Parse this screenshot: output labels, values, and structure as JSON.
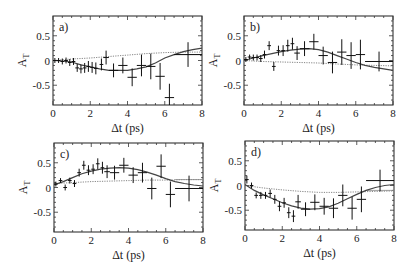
{
  "figure": {
    "ylabel": "A_T",
    "xlabel": "Δt (ps)",
    "x_ticks": [
      "0",
      "2",
      "4",
      "6",
      "8"
    ],
    "y_ticks": [
      "0.5",
      "0",
      "-0.5"
    ]
  },
  "chart_data": [
    {
      "type": "scatter",
      "panel": "a)",
      "xlabel": "Δt (ps)",
      "ylabel": "A_T",
      "xlim": [
        0,
        8
      ],
      "ylim": [
        -0.9,
        0.9
      ],
      "grid": false,
      "frame": {
        "left": 53,
        "right": 202,
        "top": 16,
        "bottom": 105
      },
      "points": [
        {
          "x": 0.1,
          "y": 0.0,
          "xerr": 0.1,
          "yerr": 0.05
        },
        {
          "x": 0.3,
          "y": 0.0,
          "xerr": 0.1,
          "yerr": 0.05
        },
        {
          "x": 0.5,
          "y": -0.02,
          "xerr": 0.1,
          "yerr": 0.06
        },
        {
          "x": 0.7,
          "y": 0.0,
          "xerr": 0.1,
          "yerr": 0.06
        },
        {
          "x": 0.9,
          "y": -0.04,
          "xerr": 0.1,
          "yerr": 0.07
        },
        {
          "x": 1.1,
          "y": -0.02,
          "xerr": 0.1,
          "yerr": 0.07
        },
        {
          "x": 1.3,
          "y": -0.15,
          "xerr": 0.1,
          "yerr": 0.08
        },
        {
          "x": 1.5,
          "y": -0.17,
          "xerr": 0.1,
          "yerr": 0.09
        },
        {
          "x": 1.7,
          "y": -0.15,
          "xerr": 0.1,
          "yerr": 0.1
        },
        {
          "x": 1.9,
          "y": -0.12,
          "xerr": 0.1,
          "yerr": 0.11
        },
        {
          "x": 2.1,
          "y": -0.14,
          "xerr": 0.1,
          "yerr": 0.11
        },
        {
          "x": 2.3,
          "y": -0.16,
          "xerr": 0.1,
          "yerr": 0.12
        },
        {
          "x": 2.6,
          "y": -0.08,
          "xerr": 0.1,
          "yerr": 0.12
        },
        {
          "x": 2.85,
          "y": 0.06,
          "xerr": 0.15,
          "yerr": 0.14
        },
        {
          "x": 3.25,
          "y": -0.2,
          "xerr": 0.25,
          "yerr": 0.14
        },
        {
          "x": 3.75,
          "y": -0.1,
          "xerr": 0.25,
          "yerr": 0.16
        },
        {
          "x": 4.25,
          "y": -0.34,
          "xerr": 0.25,
          "yerr": 0.18
        },
        {
          "x": 4.75,
          "y": -0.1,
          "xerr": 0.25,
          "yerr": 0.22
        },
        {
          "x": 5.25,
          "y": -0.12,
          "xerr": 0.25,
          "yerr": 0.26
        },
        {
          "x": 5.75,
          "y": -0.32,
          "xerr": 0.25,
          "yerr": 0.27
        },
        {
          "x": 6.25,
          "y": -0.75,
          "xerr": 0.25,
          "yerr": 0.28
        },
        {
          "x": 7.25,
          "y": 0.12,
          "xerr": 0.75,
          "yerr": 0.25
        }
      ],
      "fit_solid": [
        [
          0,
          0
        ],
        [
          0.5,
          -0.01
        ],
        [
          1,
          -0.03
        ],
        [
          1.5,
          -0.09
        ],
        [
          2,
          -0.13
        ],
        [
          2.5,
          -0.17
        ],
        [
          3,
          -0.2
        ],
        [
          3.5,
          -0.2
        ],
        [
          4,
          -0.2
        ],
        [
          4.5,
          -0.17
        ],
        [
          5,
          -0.13
        ],
        [
          5.5,
          -0.05
        ],
        [
          6,
          0.05
        ],
        [
          6.5,
          0.12
        ],
        [
          7,
          0.18
        ],
        [
          7.5,
          0.22
        ],
        [
          8,
          0.25
        ]
      ],
      "fit_dotted": [
        [
          0,
          0.0
        ],
        [
          1,
          0.03
        ],
        [
          2,
          0.05
        ],
        [
          3,
          0.08
        ],
        [
          4,
          0.11
        ],
        [
          5,
          0.14
        ],
        [
          6,
          0.16
        ],
        [
          7,
          0.17
        ],
        [
          8,
          0.17
        ]
      ],
      "fit_dotted_flat": [
        [
          6.5,
          0.12
        ],
        [
          8,
          0.12
        ]
      ]
    },
    {
      "type": "scatter",
      "panel": "b)",
      "xlabel": "Δt (ps)",
      "ylabel": "A_T",
      "xlim": [
        0,
        8
      ],
      "ylim": [
        -0.9,
        0.9
      ],
      "grid": false,
      "frame": {
        "left": 244,
        "right": 393,
        "top": 16,
        "bottom": 105
      },
      "points": [
        {
          "x": 0.1,
          "y": 0.02,
          "xerr": 0.1,
          "yerr": 0.05
        },
        {
          "x": 0.3,
          "y": 0.07,
          "xerr": 0.1,
          "yerr": 0.05
        },
        {
          "x": 0.5,
          "y": 0.06,
          "xerr": 0.1,
          "yerr": 0.06
        },
        {
          "x": 0.7,
          "y": 0.06,
          "xerr": 0.1,
          "yerr": 0.06
        },
        {
          "x": 0.9,
          "y": 0.04,
          "xerr": 0.1,
          "yerr": 0.07
        },
        {
          "x": 1.1,
          "y": 0.12,
          "xerr": 0.1,
          "yerr": 0.08
        },
        {
          "x": 1.35,
          "y": 0.3,
          "xerr": 0.1,
          "yerr": 0.09
        },
        {
          "x": 1.6,
          "y": -0.12,
          "xerr": 0.1,
          "yerr": 0.09
        },
        {
          "x": 1.85,
          "y": 0.2,
          "xerr": 0.1,
          "yerr": 0.1
        },
        {
          "x": 2.1,
          "y": 0.2,
          "xerr": 0.1,
          "yerr": 0.11
        },
        {
          "x": 2.35,
          "y": 0.3,
          "xerr": 0.1,
          "yerr": 0.12
        },
        {
          "x": 2.6,
          "y": 0.34,
          "xerr": 0.1,
          "yerr": 0.12
        },
        {
          "x": 2.85,
          "y": 0.15,
          "xerr": 0.15,
          "yerr": 0.14
        },
        {
          "x": 3.25,
          "y": 0.24,
          "xerr": 0.25,
          "yerr": 0.15
        },
        {
          "x": 3.75,
          "y": 0.38,
          "xerr": 0.25,
          "yerr": 0.16
        },
        {
          "x": 4.25,
          "y": 0.1,
          "xerr": 0.25,
          "yerr": 0.18
        },
        {
          "x": 4.75,
          "y": -0.04,
          "xerr": 0.25,
          "yerr": 0.22
        },
        {
          "x": 5.25,
          "y": 0.17,
          "xerr": 0.25,
          "yerr": 0.26
        },
        {
          "x": 5.75,
          "y": 0.1,
          "xerr": 0.25,
          "yerr": 0.27
        },
        {
          "x": 6.25,
          "y": 0.12,
          "xerr": 0.25,
          "yerr": 0.3
        },
        {
          "x": 7.25,
          "y": -0.02,
          "xerr": 0.75,
          "yerr": 0.2
        }
      ],
      "fit_solid": [
        [
          0,
          0
        ],
        [
          0.5,
          0.05
        ],
        [
          1,
          0.1
        ],
        [
          1.5,
          0.14
        ],
        [
          2,
          0.18
        ],
        [
          2.5,
          0.21
        ],
        [
          3,
          0.23
        ],
        [
          3.5,
          0.24
        ],
        [
          4,
          0.22
        ],
        [
          4.5,
          0.17
        ],
        [
          5,
          0.1
        ],
        [
          5.5,
          0.03
        ],
        [
          6,
          -0.04
        ],
        [
          6.5,
          -0.1
        ],
        [
          7,
          -0.14
        ],
        [
          7.5,
          -0.17
        ],
        [
          8,
          -0.2
        ]
      ],
      "fit_dotted": [
        [
          0,
          0
        ],
        [
          1,
          -0.02
        ],
        [
          2,
          -0.03
        ],
        [
          3,
          -0.04
        ],
        [
          4,
          -0.05
        ],
        [
          5,
          -0.07
        ],
        [
          6,
          -0.09
        ],
        [
          7,
          -0.1
        ],
        [
          8,
          -0.11
        ]
      ],
      "fit_dotted_flat": [
        [
          6.5,
          -0.02
        ],
        [
          8,
          -0.02
        ]
      ]
    },
    {
      "type": "scatter",
      "panel": "c)",
      "xlabel": "Δt (ps)",
      "ylabel": "A_T",
      "xlim": [
        0,
        8
      ],
      "ylim": [
        -0.9,
        0.9
      ],
      "grid": false,
      "frame": {
        "left": 54,
        "right": 203,
        "top": 143,
        "bottom": 232
      },
      "points": [
        {
          "x": 0.1,
          "y": 0.07,
          "xerr": 0.1,
          "yerr": 0.05
        },
        {
          "x": 0.35,
          "y": 0.14,
          "xerr": 0.1,
          "yerr": 0.05
        },
        {
          "x": 0.6,
          "y": 0.0,
          "xerr": 0.1,
          "yerr": 0.06
        },
        {
          "x": 0.85,
          "y": 0.14,
          "xerr": 0.1,
          "yerr": 0.06
        },
        {
          "x": 1.1,
          "y": 0.08,
          "xerr": 0.1,
          "yerr": 0.07
        },
        {
          "x": 1.35,
          "y": 0.3,
          "xerr": 0.1,
          "yerr": 0.08
        },
        {
          "x": 1.6,
          "y": 0.45,
          "xerr": 0.1,
          "yerr": 0.09
        },
        {
          "x": 1.85,
          "y": 0.35,
          "xerr": 0.1,
          "yerr": 0.1
        },
        {
          "x": 2.1,
          "y": 0.37,
          "xerr": 0.1,
          "yerr": 0.1
        },
        {
          "x": 2.35,
          "y": 0.48,
          "xerr": 0.1,
          "yerr": 0.11
        },
        {
          "x": 2.6,
          "y": 0.4,
          "xerr": 0.1,
          "yerr": 0.12
        },
        {
          "x": 2.85,
          "y": 0.32,
          "xerr": 0.15,
          "yerr": 0.13
        },
        {
          "x": 3.25,
          "y": 0.3,
          "xerr": 0.25,
          "yerr": 0.14
        },
        {
          "x": 3.75,
          "y": 0.45,
          "xerr": 0.25,
          "yerr": 0.15
        },
        {
          "x": 4.25,
          "y": 0.25,
          "xerr": 0.25,
          "yerr": 0.16
        },
        {
          "x": 4.75,
          "y": 0.3,
          "xerr": 0.25,
          "yerr": 0.2
        },
        {
          "x": 5.25,
          "y": -0.02,
          "xerr": 0.25,
          "yerr": 0.22
        },
        {
          "x": 5.75,
          "y": 0.43,
          "xerr": 0.25,
          "yerr": 0.24
        },
        {
          "x": 6.25,
          "y": -0.14,
          "xerr": 0.25,
          "yerr": 0.26
        },
        {
          "x": 7.25,
          "y": -0.02,
          "xerr": 0.75,
          "yerr": 0.26
        }
      ],
      "fit_solid": [
        [
          0,
          0.05
        ],
        [
          0.5,
          0.12
        ],
        [
          1,
          0.2
        ],
        [
          1.5,
          0.28
        ],
        [
          2,
          0.33
        ],
        [
          2.5,
          0.37
        ],
        [
          3,
          0.39
        ],
        [
          3.5,
          0.4
        ],
        [
          4,
          0.39
        ],
        [
          4.5,
          0.36
        ],
        [
          5,
          0.31
        ],
        [
          5.5,
          0.25
        ],
        [
          6,
          0.18
        ],
        [
          6.5,
          0.12
        ],
        [
          7,
          0.08
        ],
        [
          7.5,
          0.05
        ],
        [
          8,
          0.03
        ]
      ],
      "fit_dotted": [
        [
          0,
          0.08
        ],
        [
          1,
          0.1
        ],
        [
          2,
          0.12
        ],
        [
          3,
          0.13
        ],
        [
          4,
          0.14
        ],
        [
          5,
          0.15
        ],
        [
          6,
          0.15
        ],
        [
          7,
          0.16
        ],
        [
          8,
          0.16
        ]
      ],
      "fit_dotted_flat": [
        [
          6.5,
          0.16
        ],
        [
          8,
          0.16
        ]
      ]
    },
    {
      "type": "scatter",
      "panel": "d)",
      "xlabel": "Δt (ps)",
      "ylabel": "A_T",
      "xlim": [
        0,
        8
      ],
      "ylim": [
        -0.9,
        0.9
      ],
      "grid": false,
      "frame": {
        "left": 245,
        "right": 394,
        "top": 141,
        "bottom": 230
      },
      "points": [
        {
          "x": 0.1,
          "y": 0.12,
          "xerr": 0.1,
          "yerr": 0.08
        },
        {
          "x": 0.35,
          "y": 0.0,
          "xerr": 0.1,
          "yerr": 0.06
        },
        {
          "x": 0.6,
          "y": -0.2,
          "xerr": 0.1,
          "yerr": 0.06
        },
        {
          "x": 0.85,
          "y": -0.2,
          "xerr": 0.1,
          "yerr": 0.07
        },
        {
          "x": 1.1,
          "y": -0.2,
          "xerr": 0.1,
          "yerr": 0.07
        },
        {
          "x": 1.35,
          "y": -0.16,
          "xerr": 0.1,
          "yerr": 0.08
        },
        {
          "x": 1.6,
          "y": -0.28,
          "xerr": 0.1,
          "yerr": 0.09
        },
        {
          "x": 1.85,
          "y": -0.42,
          "xerr": 0.1,
          "yerr": 0.1
        },
        {
          "x": 2.1,
          "y": -0.35,
          "xerr": 0.1,
          "yerr": 0.1
        },
        {
          "x": 2.35,
          "y": -0.55,
          "xerr": 0.1,
          "yerr": 0.11
        },
        {
          "x": 2.6,
          "y": -0.62,
          "xerr": 0.1,
          "yerr": 0.12
        },
        {
          "x": 2.85,
          "y": -0.33,
          "xerr": 0.15,
          "yerr": 0.14
        },
        {
          "x": 3.25,
          "y": -0.48,
          "xerr": 0.25,
          "yerr": 0.14
        },
        {
          "x": 3.75,
          "y": -0.34,
          "xerr": 0.25,
          "yerr": 0.16
        },
        {
          "x": 4.25,
          "y": -0.42,
          "xerr": 0.25,
          "yerr": 0.17
        },
        {
          "x": 4.75,
          "y": -0.46,
          "xerr": 0.25,
          "yerr": 0.2
        },
        {
          "x": 5.25,
          "y": -0.2,
          "xerr": 0.25,
          "yerr": 0.22
        },
        {
          "x": 5.75,
          "y": -0.46,
          "xerr": 0.25,
          "yerr": 0.23
        },
        {
          "x": 6.25,
          "y": -0.28,
          "xerr": 0.25,
          "yerr": 0.26
        },
        {
          "x": 7.25,
          "y": 0.1,
          "xerr": 0.75,
          "yerr": 0.22
        }
      ],
      "fit_solid": [
        [
          0,
          0.02
        ],
        [
          0.5,
          -0.1
        ],
        [
          1,
          -0.19
        ],
        [
          1.5,
          -0.27
        ],
        [
          2,
          -0.35
        ],
        [
          2.5,
          -0.41
        ],
        [
          3,
          -0.46
        ],
        [
          3.5,
          -0.48
        ],
        [
          4,
          -0.47
        ],
        [
          4.5,
          -0.43
        ],
        [
          5,
          -0.36
        ],
        [
          5.5,
          -0.27
        ],
        [
          6,
          -0.18
        ],
        [
          6.5,
          -0.1
        ],
        [
          7,
          -0.04
        ],
        [
          7.5,
          0.0
        ],
        [
          8,
          0.02
        ]
      ],
      "fit_dotted": [
        [
          0,
          0.0
        ],
        [
          1,
          -0.05
        ],
        [
          2,
          -0.09
        ],
        [
          3,
          -0.12
        ],
        [
          4,
          -0.14
        ],
        [
          5,
          -0.14
        ],
        [
          6,
          -0.13
        ],
        [
          7,
          -0.12
        ],
        [
          8,
          -0.11
        ]
      ],
      "fit_dotted_flat": [
        [
          6.5,
          -0.1
        ],
        [
          8,
          -0.1
        ]
      ]
    }
  ]
}
